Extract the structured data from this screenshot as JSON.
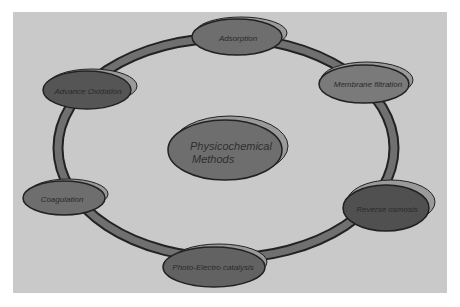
{
  "diagram": {
    "type": "cycle",
    "center": {
      "line1": "Physicochemical",
      "line2": "Methods"
    },
    "nodes": [
      {
        "id": "adsorption",
        "label": "Adsorption"
      },
      {
        "id": "membrane-filtration",
        "label": "Membrane filtration"
      },
      {
        "id": "reverse-osmosis",
        "label": "Reverse osmosis"
      },
      {
        "id": "photo-electro-catalysis",
        "label": "Photo-Electro catalysis"
      },
      {
        "id": "coagulation",
        "label": "Coagulation"
      },
      {
        "id": "advance-oxidation",
        "label": "Advance Oxidation"
      }
    ],
    "colors": {
      "background": "#c9c9c9",
      "ring_fill": "#707070",
      "ring_outline": "#222222",
      "node_light": "#7a7a7a",
      "node_medium": "#6a6a6a",
      "node_dark": "#505050",
      "node_shadow": "#9a9a9a"
    }
  }
}
